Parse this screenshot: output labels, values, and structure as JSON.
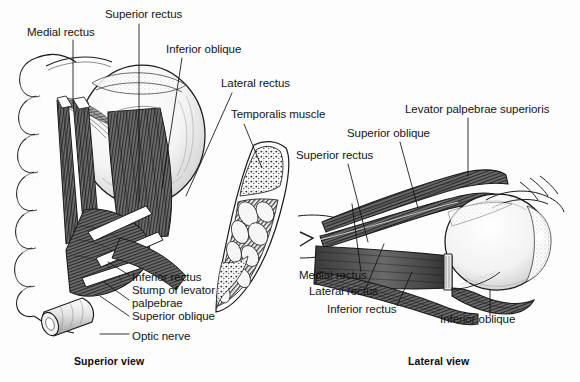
{
  "figure": {
    "title_alt": "Extraocular muscles of the eye",
    "background_color": "#fdfdfd",
    "ink_color": "#1a1a1a",
    "panels": [
      {
        "name": "superior-view",
        "caption": "Superior view",
        "caption_x": 74,
        "caption_y": 362,
        "labels": [
          {
            "id": "medial-rectus",
            "text": "Medial rectus",
            "x": 27,
            "y": 33,
            "anchor": "start"
          },
          {
            "id": "superior-rectus",
            "text": "Superior rectus",
            "x": 105,
            "y": 15,
            "anchor": "start"
          },
          {
            "id": "inferior-oblique",
            "text": "Inferior oblique",
            "x": 166,
            "y": 50,
            "anchor": "start"
          },
          {
            "id": "lateral-rectus",
            "text": "Lateral rectus",
            "x": 221,
            "y": 84,
            "anchor": "start"
          },
          {
            "id": "inferior-rectus",
            "text": "Inferior rectus",
            "x": 132,
            "y": 278,
            "anchor": "start"
          },
          {
            "id": "stump-levator",
            "text": "Stump of levator",
            "x": 132,
            "y": 291,
            "anchor": "start"
          },
          {
            "id": "palpebrae",
            "text": "palpebrae",
            "x": 132,
            "y": 304,
            "anchor": "start"
          },
          {
            "id": "superior-oblique",
            "text": "Superior oblique",
            "x": 132,
            "y": 317,
            "anchor": "start"
          },
          {
            "id": "optic-nerve",
            "text": "Optic nerve",
            "x": 132,
            "y": 337,
            "anchor": "start"
          }
        ]
      },
      {
        "name": "skull-section",
        "labels": [
          {
            "id": "temporalis-muscle",
            "text": "Temporalis muscle",
            "x": 231,
            "y": 115,
            "anchor": "start"
          }
        ]
      },
      {
        "name": "lateral-view",
        "caption": "Lateral view",
        "caption_x": 408,
        "caption_y": 362,
        "labels": [
          {
            "id": "levator-palpebrae-superioris",
            "text": "Levator palpebrae superioris",
            "x": 405,
            "y": 110,
            "anchor": "start"
          },
          {
            "id": "superior-oblique-lat",
            "text": "Superior oblique",
            "x": 347,
            "y": 134,
            "anchor": "start"
          },
          {
            "id": "superior-rectus-lat",
            "text": "Superior rectus",
            "x": 296,
            "y": 156,
            "anchor": "start"
          },
          {
            "id": "medial-rectus-lat",
            "text": "Medial rectus",
            "x": 299,
            "y": 276,
            "anchor": "start"
          },
          {
            "id": "lateral-rectus-lat",
            "text": "Lateral rectus",
            "x": 309,
            "y": 292,
            "anchor": "start"
          },
          {
            "id": "inferior-rectus-lat",
            "text": "Inferior rectus",
            "x": 327,
            "y": 310,
            "anchor": "start"
          },
          {
            "id": "inferior-oblique-lat",
            "text": "Inferior oblique",
            "x": 440,
            "y": 320,
            "anchor": "start"
          }
        ]
      }
    ]
  }
}
